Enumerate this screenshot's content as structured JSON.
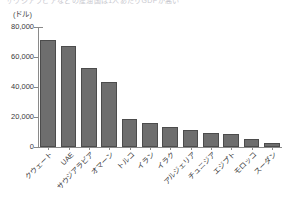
{
  "caption": {
    "top_strip_text": "サウジアラビアなどの産油国は1人あたりGDPが高い"
  },
  "chart_data": {
    "type": "bar",
    "title": "",
    "subtitle": "",
    "xlabel": "",
    "ylabel": "",
    "unit_label": "(ドル)",
    "categories": [
      "クウェート",
      "UAE",
      "サウジアラビア",
      "オマーン",
      "トルコ",
      "イラン",
      "イラク",
      "アルジェリア",
      "チュニジア",
      "エジプト",
      "モロッコ",
      "スーダン"
    ],
    "values": [
      71500,
      67500,
      53000,
      43500,
      19000,
      16000,
      13500,
      11500,
      9500,
      9000,
      5500,
      3000
    ],
    "ylim": [
      0,
      80000
    ],
    "ytick_values": [
      0,
      20000,
      40000,
      60000,
      80000
    ],
    "ytick_labels": [
      "0",
      "20,000",
      "40,000",
      "60,000",
      "80,000"
    ],
    "grid": false,
    "legend": null,
    "bar_color": "#6e6e6e",
    "bar_edge_color": "#4c4c4c",
    "axis_color": "#8a8a8a"
  }
}
